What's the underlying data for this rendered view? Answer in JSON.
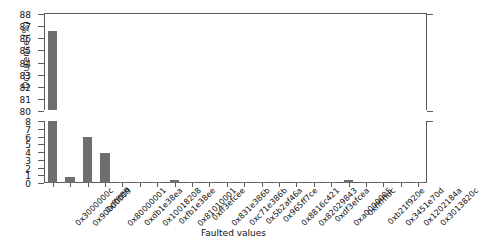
{
  "chart_data": {
    "type": "bar",
    "title": "",
    "xlabel": "Faulted values",
    "ylabel": "Occurence (%)",
    "broken_axis": true,
    "ylim_lower": [
      0,
      8
    ],
    "ylim_upper": [
      80,
      88
    ],
    "yticks_lower": [
      "0",
      "1",
      "2",
      "3",
      "4",
      "5",
      "6",
      "7",
      "8"
    ],
    "yticks_upper": [
      "80",
      "81",
      "82",
      "83",
      "84",
      "85",
      "86",
      "87",
      "88"
    ],
    "grid": false,
    "legend": null,
    "bar_color": "#6e6e6e",
    "categories": [
      "0x3000000c",
      "0x90000009",
      "0xffffffff",
      "0x80000001",
      "0xdb1e38ea",
      "0x10018208",
      "0xfb1e38ee",
      "0x81010001",
      "0xff3efcee",
      "0x831e386b",
      "0xc71e386b",
      "0x5b2af46a",
      "0x965ff7ce",
      "0x8816c421",
      "0x82029843",
      "0xdf3efcea",
      "0xa0000005",
      "0xffffffdc",
      "0xb21f920e",
      "0x3451e70d",
      "0x1202184a",
      "0x3013820c"
    ],
    "values": [
      86.5,
      0.72,
      5.9,
      3.85,
      0.12,
      0.1,
      0.1,
      0.35,
      0.1,
      0.1,
      0.1,
      0.1,
      0.1,
      0.1,
      0.1,
      0.1,
      0.1,
      0.42,
      0.1,
      0.1,
      0.1,
      0.1
    ]
  }
}
